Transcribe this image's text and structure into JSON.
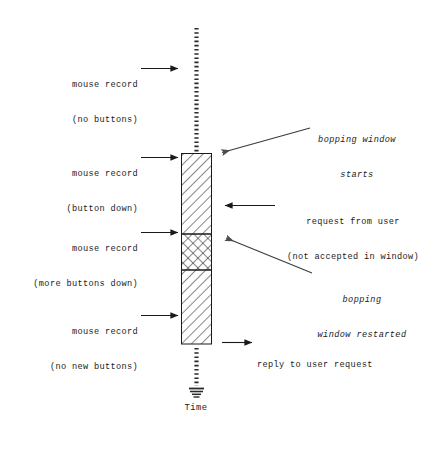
{
  "figure": {
    "type": "timeline-diagram",
    "axis_caption": "Time",
    "background_color": "#ffffff",
    "line_color": "#1a1a1a"
  },
  "timeline": {
    "top_dotted_segment": {
      "from_y": 28,
      "to_y": 153
    },
    "bottom_dotted_segment": {
      "from_y": 348,
      "to_y": 400
    },
    "ground_symbol": true
  },
  "window_bar": {
    "x": 181,
    "width": 31,
    "top_y": 153,
    "bottom_y": 344,
    "segments": [
      {
        "name": "bopping-window-first",
        "pattern": "diagonal-hatch",
        "from_y": 153,
        "to_y": 234
      },
      {
        "name": "bopping-window-overlap",
        "pattern": "cross-hatch",
        "from_y": 234,
        "to_y": 270
      },
      {
        "name": "bopping-window-restarted",
        "pattern": "diagonal-hatch",
        "from_y": 270,
        "to_y": 344
      }
    ]
  },
  "left_labels": [
    {
      "name": "mouse-record-no-buttons",
      "line1": "mouse record",
      "line2": "(no buttons)",
      "arrow": "right"
    },
    {
      "name": "mouse-record-button-down",
      "line1": "mouse record",
      "line2": "(button down)",
      "arrow": "right"
    },
    {
      "name": "mouse-record-more-buttons-down",
      "line1": "mouse record",
      "line2": "(more buttons down)",
      "arrow": "right"
    },
    {
      "name": "mouse-record-no-new-buttons",
      "line1": "mouse record",
      "line2": "(no new buttons)",
      "arrow": "right"
    }
  ],
  "right_labels": [
    {
      "name": "bopping-window-starts",
      "line1": "bopping window",
      "line2": "starts",
      "italic": true,
      "arrow": "diagonal-left"
    },
    {
      "name": "request-from-user",
      "line1": "request from user",
      "line2": "(not accepted in window)",
      "italic": false,
      "arrow": "left"
    },
    {
      "name": "bopping-window-restarted",
      "line1": "bopping",
      "line2": "window restarted",
      "italic": true,
      "arrow": "diagonal-left"
    },
    {
      "name": "reply-to-user-request",
      "line1": "reply to user request",
      "line2": "",
      "italic": false,
      "arrow": "right"
    }
  ]
}
